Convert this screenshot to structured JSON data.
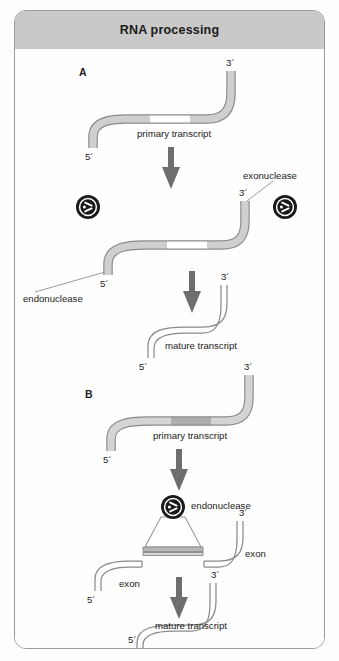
{
  "figure": {
    "title": "RNA processing",
    "border_color": "#9b9b9b",
    "header_bg": "#c9c9c9",
    "canvas_bg": "#fefefe",
    "strand_fill": "#cfcfcf",
    "strand_dark": "#b3b3b3",
    "strand_stroke": "#8a8a8a",
    "arrow_color": "#6e6e6e",
    "icon_color": "#1a1a1a"
  },
  "panels": [
    {
      "id": "A",
      "letter": "A",
      "steps": [
        {
          "name": "primary-transcript",
          "label": "primary transcript",
          "five_prime": "5´",
          "three_prime": "3´",
          "middle_segment": "light"
        },
        {
          "name": "cleavage",
          "left_enzyme": "endonuclease",
          "right_enzyme": "exonuclease",
          "five_prime": "5´",
          "three_prime": "3´"
        },
        {
          "name": "mature-transcript",
          "label": "mature transcript",
          "five_prime": "5´",
          "three_prime": "3´"
        }
      ]
    },
    {
      "id": "B",
      "letter": "B",
      "steps": [
        {
          "name": "primary-transcript",
          "label": "primary transcript",
          "five_prime": "5´",
          "three_prime": "3´",
          "middle_segment": "dark"
        },
        {
          "name": "endonuclease-cut",
          "enzyme": "endonuclease",
          "exon_left": "exon",
          "exon_right": "exon",
          "five_prime": "5´",
          "three_prime": "3´"
        },
        {
          "name": "mature-transcript",
          "label": "mature transcript",
          "five_prime": "5´",
          "three_prime": "3´"
        }
      ]
    }
  ],
  "labels": {
    "panel_a_letter": "A",
    "panel_b_letter": "B",
    "primary_transcript": "primary transcript",
    "mature_transcript": "mature transcript",
    "endonuclease": "endonuclease",
    "exonuclease": "exonuclease",
    "exon": "exon",
    "five_prime": "5´",
    "three_prime": "3´"
  }
}
